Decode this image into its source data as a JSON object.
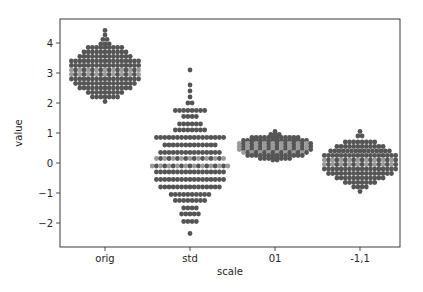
{
  "chart_data": {
    "type": "swarm",
    "title": "",
    "xlabel": "scale",
    "ylabel": "value",
    "categories": [
      "orig",
      "std",
      "01",
      "-1,1"
    ],
    "ylim": [
      -2.8,
      4.8
    ],
    "yticks": [
      -2,
      -1,
      0,
      1,
      2,
      3,
      4
    ],
    "grid": false,
    "legend": null,
    "point_color": "#555555",
    "overlap_color": "#9a9a9a",
    "series": [
      {
        "name": "orig",
        "min": 2.05,
        "max": 4.42,
        "median": 3.0,
        "rows": [
          [
            4.42,
            1
          ],
          [
            4.27,
            1
          ],
          [
            4.12,
            2
          ],
          [
            3.97,
            3
          ],
          [
            3.85,
            9
          ],
          [
            3.7,
            11
          ],
          [
            3.55,
            13
          ],
          [
            3.4,
            17
          ],
          [
            3.25,
            17
          ],
          [
            3.1,
            17
          ],
          [
            2.95,
            17
          ],
          [
            2.8,
            17
          ],
          [
            2.65,
            15
          ],
          [
            2.5,
            13
          ],
          [
            2.35,
            9
          ],
          [
            2.2,
            7
          ],
          [
            2.05,
            1
          ]
        ]
      },
      {
        "name": "std",
        "min": -2.35,
        "max": 3.1,
        "median": 0.0,
        "rows": [
          [
            3.1,
            1
          ],
          [
            2.6,
            1
          ],
          [
            2.4,
            1
          ],
          [
            2.2,
            1
          ],
          [
            2.0,
            2
          ],
          [
            1.75,
            8
          ],
          [
            1.55,
            4
          ],
          [
            1.3,
            6
          ],
          [
            1.1,
            8
          ],
          [
            0.85,
            17
          ],
          [
            0.6,
            13
          ],
          [
            0.35,
            15
          ],
          [
            0.15,
            17
          ],
          [
            -0.1,
            19
          ],
          [
            -0.3,
            17
          ],
          [
            -0.55,
            17
          ],
          [
            -0.8,
            15
          ],
          [
            -1.05,
            10
          ],
          [
            -1.25,
            8
          ],
          [
            -1.5,
            4
          ],
          [
            -1.7,
            5
          ],
          [
            -1.95,
            4
          ],
          [
            -2.35,
            1
          ]
        ]
      },
      {
        "name": "01",
        "min": 0.1,
        "max": 1.05,
        "median": 0.5,
        "rows": [
          [
            1.05,
            1
          ],
          [
            0.95,
            3
          ],
          [
            0.85,
            12
          ],
          [
            0.75,
            16
          ],
          [
            0.65,
            18
          ],
          [
            0.55,
            18
          ],
          [
            0.45,
            18
          ],
          [
            0.35,
            16
          ],
          [
            0.25,
            14
          ],
          [
            0.15,
            8
          ],
          [
            0.1,
            2
          ]
        ]
      },
      {
        "name": "-1,1",
        "min": -0.95,
        "max": 1.05,
        "median": 0.0,
        "rows": [
          [
            1.05,
            1
          ],
          [
            0.9,
            2
          ],
          [
            0.7,
            8
          ],
          [
            0.55,
            12
          ],
          [
            0.4,
            15
          ],
          [
            0.25,
            18
          ],
          [
            0.1,
            18
          ],
          [
            -0.05,
            18
          ],
          [
            -0.2,
            18
          ],
          [
            -0.35,
            16
          ],
          [
            -0.5,
            12
          ],
          [
            -0.65,
            8
          ],
          [
            -0.8,
            4
          ],
          [
            -0.95,
            1
          ]
        ]
      }
    ]
  }
}
